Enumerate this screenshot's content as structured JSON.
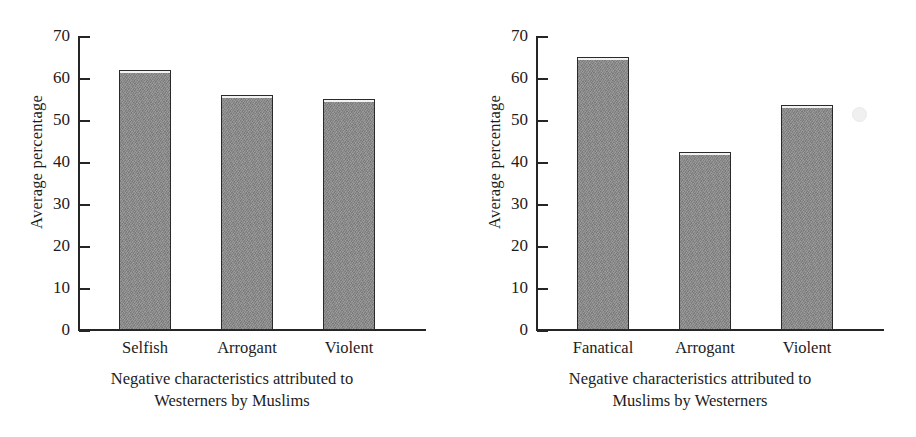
{
  "chart_data": [
    {
      "type": "bar",
      "panel": "left",
      "title": "",
      "categories": [
        "Selfish",
        "Arrogant",
        "Violent"
      ],
      "values": [
        62,
        56,
        55
      ],
      "xlabel_line1": "Negative characteristics attributed to",
      "xlabel_line2": "Westerners by Muslims",
      "ylabel": "Average percentage",
      "yticks": [
        0,
        10,
        20,
        30,
        40,
        50,
        60,
        70
      ],
      "ytick_labels": [
        "0",
        "10",
        "20",
        "30",
        "40",
        "50",
        "60",
        "70"
      ],
      "ylim": [
        0,
        70
      ],
      "grid": false,
      "legend": "none",
      "bar_color": "#8b8b8b",
      "bar_edge_color": "#2a2a2a"
    },
    {
      "type": "bar",
      "panel": "right",
      "title": "",
      "categories": [
        "Fanatical",
        "Arrogant",
        "Violent"
      ],
      "values": [
        65,
        42.5,
        53.5
      ],
      "xlabel_line1": "Negative characteristics attributed to",
      "xlabel_line2": "Muslims by Westerners",
      "ylabel": "Average percentage",
      "yticks": [
        0,
        10,
        20,
        30,
        40,
        50,
        60,
        70
      ],
      "ytick_labels": [
        "0",
        "10",
        "20",
        "30",
        "40",
        "50",
        "60",
        "70"
      ],
      "ylim": [
        0,
        70
      ],
      "grid": false,
      "legend": "none",
      "bar_color": "#8b8b8b",
      "bar_edge_color": "#2a2a2a"
    }
  ]
}
